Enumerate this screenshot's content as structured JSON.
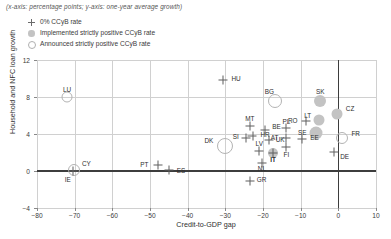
{
  "note": "(x-axis: percentage points; y-axis: one-year average growth)",
  "legend": {
    "position": "top-left",
    "items": [
      {
        "marker": "plus",
        "label": "0% CCyB rate"
      },
      {
        "marker": "filled",
        "label": "Implemented strictly positive CCyB rate"
      },
      {
        "marker": "open",
        "label": "Announced strictly positive CCyB rate"
      }
    ]
  },
  "colors": {
    "marker_plus": "#5e5e5e",
    "marker_filled": "#c3c3c3",
    "marker_open_stroke": "#b3b3b3",
    "grid": "#d0d0d0",
    "axis_zero": "#3d3d3d",
    "text": "#2e2e2e",
    "background": "#ffffff"
  },
  "chart_data": {
    "type": "scatter",
    "title": "",
    "xlabel": "Credit-to-GDP gap",
    "ylabel": "Household and NFC loan growth",
    "xlim": [
      -80,
      10
    ],
    "ylim": [
      -4,
      12
    ],
    "xticks": [
      -80,
      -70,
      -60,
      -50,
      -40,
      -30,
      -20,
      -10,
      0,
      10
    ],
    "xtick_labels": [
      "−80",
      "−70",
      "−60",
      "−50",
      "−40",
      "−30",
      "−20",
      "−10",
      "0",
      "10"
    ],
    "yticks": [
      -4,
      0,
      4,
      8,
      12
    ],
    "ytick_labels": [
      "−4",
      "0",
      "4",
      "8",
      "12"
    ],
    "grid": true,
    "zero_lines": {
      "x": 0,
      "y": 0
    },
    "legend_position": "top-left",
    "series": [
      {
        "name": "0% CCyB rate",
        "marker": "plus",
        "points": [
          {
            "label": "IE",
            "x": -70.5,
            "y": 0.0,
            "label_dx": -2,
            "label_dy": 9
          },
          {
            "label": "PT",
            "x": -48.0,
            "y": 0.6,
            "label_dx": -9,
            "label_dy": 0
          },
          {
            "label": "ES",
            "x": -45.0,
            "y": 0.1,
            "label_dx": 8,
            "label_dy": 1
          },
          {
            "label": "HU",
            "x": -30.5,
            "y": 9.8,
            "label_dx": 8,
            "label_dy": -1
          },
          {
            "label": "MT",
            "x": -23.5,
            "y": 4.9,
            "label_dx": 0,
            "label_dy": -6
          },
          {
            "label": "SI",
            "x": -24.6,
            "y": 3.6,
            "label_dx": -7,
            "label_dy": -1
          },
          {
            "label": "HR",
            "x": -22.8,
            "y": 3.8,
            "label_dx": 8,
            "label_dy": -1
          },
          {
            "label": "BE",
            "x": -19.4,
            "y": 4.4,
            "label_dx": 7,
            "label_dy": -3
          },
          {
            "label": "LV",
            "x": -21.0,
            "y": 2.2,
            "label_dx": 0,
            "label_dy": -6
          },
          {
            "label": "NL",
            "x": -20.3,
            "y": 0.9,
            "label_dx": 0,
            "label_dy": 7
          },
          {
            "label": "IT",
            "x": -17.3,
            "y": 2.0,
            "label_dx": 0,
            "label_dy": 8
          },
          {
            "label": "UK",
            "x": -18.5,
            "y": 3.4,
            "label_dx": 7,
            "label_dy": 1
          },
          {
            "label": "GR",
            "x": -23.5,
            "y": -1.1,
            "label_dx": 7,
            "label_dy": -1
          },
          {
            "label": "PL",
            "x": -13.8,
            "y": 4.6,
            "label_dx": 0,
            "label_dy": -6
          },
          {
            "label": "AT",
            "x": -13.8,
            "y": 3.6,
            "label_dx": -8,
            "label_dy": 0
          },
          {
            "label": "FI",
            "x": -13.8,
            "y": 2.6,
            "label_dx": 0,
            "label_dy": 8
          },
          {
            "label": "RO",
            "x": -8.7,
            "y": 5.4,
            "label_dx": -8,
            "label_dy": 0
          },
          {
            "label": "EE",
            "x": -9.6,
            "y": 3.5,
            "label_dx": 8,
            "label_dy": 0
          },
          {
            "label": "DE",
            "x": -1.1,
            "y": 2.1,
            "label_dx": 6,
            "label_dy": 6
          }
        ]
      },
      {
        "name": "Implemented strictly positive CCyB rate",
        "marker": "filled",
        "points": [
          {
            "label": "SK",
            "x": -4.8,
            "y": 7.6,
            "size": 12,
            "label_dx": 0,
            "label_dy": -9
          },
          {
            "label": "CZ",
            "x": -0.4,
            "y": 6.2,
            "size": 11,
            "label_dx": 9,
            "label_dy": -4
          },
          {
            "label": "LT",
            "x": -5.1,
            "y": 5.5,
            "size": 11,
            "label_dx": -8,
            "label_dy": -4
          },
          {
            "label": "SE",
            "x": -5.8,
            "y": 4.1,
            "size": 13,
            "label_dx": -10,
            "label_dy": 0
          },
          {
            "label": "IT",
            "x": -17.3,
            "y": 2.0,
            "size": 10,
            "label_dx": 0,
            "label_dy": 8
          }
        ]
      },
      {
        "name": "Announced strictly positive CCyB rate",
        "marker": "open",
        "points": [
          {
            "label": "LU",
            "x": -72.0,
            "y": 8.0,
            "size": 9,
            "label_dx": 0,
            "label_dy": -7
          },
          {
            "label": "CY",
            "x": -70.2,
            "y": 0.1,
            "size": 10,
            "label_dx": 8,
            "label_dy": -6
          },
          {
            "label": "DK",
            "x": -30.0,
            "y": 2.7,
            "size": 14,
            "label_dx": -12,
            "label_dy": -5
          },
          {
            "label": "BG",
            "x": -16.8,
            "y": 7.6,
            "size": 12,
            "label_dx": -1,
            "label_dy": -9
          },
          {
            "label": "FR",
            "x": 1.1,
            "y": 3.6,
            "size": 10,
            "label_dx": 9,
            "label_dy": -4
          }
        ]
      }
    ]
  }
}
